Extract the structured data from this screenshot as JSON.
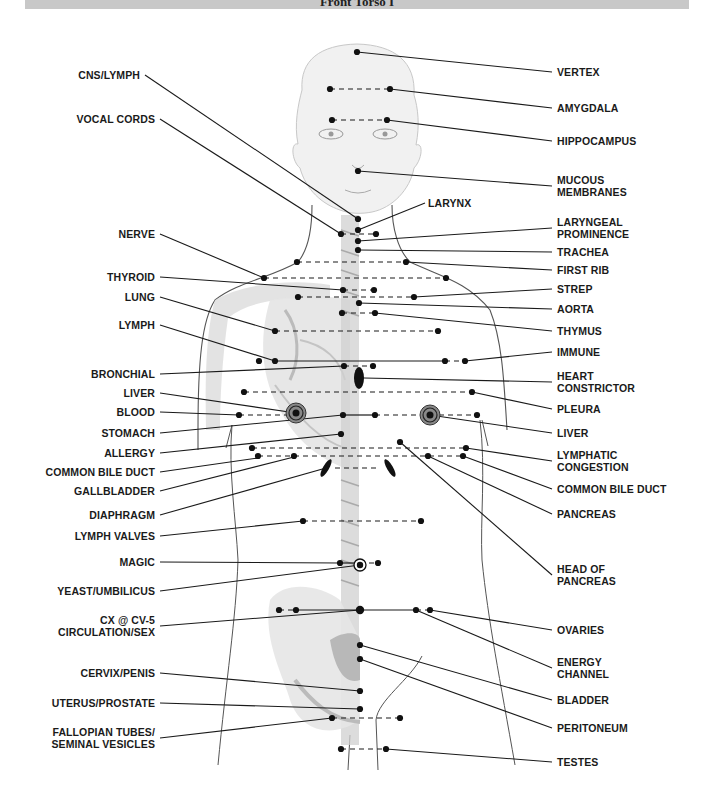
{
  "header": {
    "title": "Front Torso I"
  },
  "colors": {
    "ink": "#1a1a1a",
    "header_band": "#c8c8c8",
    "figure_shade": "#bdbdbd",
    "outline": "#555555"
  },
  "labels_left": [
    {
      "id": "cns-lymph",
      "text": "CNS/LYMPH",
      "x": 140,
      "y": 75,
      "to": [
        358,
        219
      ]
    },
    {
      "id": "vocal-cords",
      "text": "VOCAL CORDS",
      "x": 155,
      "y": 119,
      "to": [
        341,
        234
      ]
    },
    {
      "id": "nerve",
      "text": "NERVE",
      "x": 155,
      "y": 234,
      "to": [
        264,
        278
      ]
    },
    {
      "id": "thyroid",
      "text": "THYROID",
      "x": 155,
      "y": 277,
      "to": [
        343,
        290
      ]
    },
    {
      "id": "lung",
      "text": "LUNG",
      "x": 155,
      "y": 297,
      "to": [
        275,
        331
      ]
    },
    {
      "id": "lymph",
      "text": "LYMPH",
      "x": 155,
      "y": 325,
      "to": [
        275,
        361
      ]
    },
    {
      "id": "bronchial",
      "text": "BRONCHIAL",
      "x": 155,
      "y": 374,
      "to": [
        344,
        366
      ]
    },
    {
      "id": "liver-left",
      "text": "LIVER",
      "x": 155,
      "y": 393,
      "to": [
        296,
        413
      ]
    },
    {
      "id": "blood",
      "text": "BLOOD",
      "x": 155,
      "y": 412,
      "to": [
        239,
        415
      ]
    },
    {
      "id": "stomach",
      "text": "STOMACH",
      "x": 155,
      "y": 433,
      "to": [
        343,
        415
      ]
    },
    {
      "id": "allergy",
      "text": "ALLERGY",
      "x": 155,
      "y": 453,
      "to": [
        341,
        434
      ]
    },
    {
      "id": "common-bile-duct-left",
      "text": "COMMON BILE DUCT",
      "x": 155,
      "y": 472,
      "to": [
        258,
        458
      ]
    },
    {
      "id": "gallbladder",
      "text": "GALLBLADDER",
      "x": 155,
      "y": 491,
      "to": [
        294,
        457
      ]
    },
    {
      "id": "diaphragm",
      "text": "DIAPHRAGM",
      "x": 155,
      "y": 515,
      "to": [
        326,
        468
      ]
    },
    {
      "id": "lymph-valves",
      "text": "LYMPH VALVES",
      "x": 155,
      "y": 536,
      "to": [
        303,
        521
      ]
    },
    {
      "id": "magic",
      "text": "MAGIC",
      "x": 155,
      "y": 562,
      "to": [
        340,
        563
      ]
    },
    {
      "id": "yeast-umbilicus",
      "text": "YEAST/UMBILICUS",
      "x": 155,
      "y": 591,
      "to": [
        360,
        565
      ]
    },
    {
      "id": "cx-cv5",
      "text": "CX @ CV-5\nCIRCULATION/SEX",
      "x": 155,
      "y": 626,
      "to": [
        360,
        610
      ]
    },
    {
      "id": "cervix-penis",
      "text": "CERVIX/PENIS",
      "x": 155,
      "y": 673,
      "to": [
        360,
        691
      ]
    },
    {
      "id": "uterus-prostate",
      "text": "UTERUS/PROSTATE",
      "x": 155,
      "y": 703,
      "to": [
        360,
        709
      ]
    },
    {
      "id": "fallopian",
      "text": "FALLOPIAN TUBES/\nSEMINAL VESICLES",
      "x": 155,
      "y": 738,
      "to": [
        332,
        718
      ]
    }
  ],
  "labels_right": [
    {
      "id": "vertex",
      "text": "VERTEX",
      "x": 557,
      "y": 72,
      "to": [
        357,
        52
      ]
    },
    {
      "id": "amygdala",
      "text": "AMYGDALA",
      "x": 557,
      "y": 108,
      "to": [
        390,
        89
      ]
    },
    {
      "id": "hippocampus",
      "text": "HIPPOCAMPUS",
      "x": 557,
      "y": 141,
      "to": [
        387,
        120
      ]
    },
    {
      "id": "mucous-membranes",
      "text": "MUCOUS\nMEMBRANES",
      "x": 557,
      "y": 186,
      "to": [
        358,
        171
      ]
    },
    {
      "id": "larynx",
      "text": "LARYNX",
      "x": 428,
      "y": 203,
      "to": [
        358,
        230
      ],
      "anchor": [
        425,
        203
      ]
    },
    {
      "id": "laryngeal-prominence",
      "text": "LARYNGEAL\nPROMINENCE",
      "x": 557,
      "y": 228,
      "to": [
        358,
        241
      ]
    },
    {
      "id": "trachea",
      "text": "TRACHEA",
      "x": 557,
      "y": 252,
      "to": [
        358,
        250
      ]
    },
    {
      "id": "first-rib",
      "text": "FIRST RIB",
      "x": 557,
      "y": 270,
      "to": [
        406,
        262
      ]
    },
    {
      "id": "strep",
      "text": "STREP",
      "x": 557,
      "y": 289,
      "to": [
        414,
        297
      ]
    },
    {
      "id": "aorta",
      "text": "AORTA",
      "x": 557,
      "y": 309,
      "to": [
        359,
        303
      ]
    },
    {
      "id": "thymus",
      "text": "THYMUS",
      "x": 557,
      "y": 331,
      "to": [
        375,
        313
      ]
    },
    {
      "id": "immune",
      "text": "IMMUNE",
      "x": 557,
      "y": 352,
      "to": [
        465,
        361
      ]
    },
    {
      "id": "heart-constrictor",
      "text": "HEART\nCONSTRICTOR",
      "x": 557,
      "y": 382,
      "to": [
        364,
        378
      ]
    },
    {
      "id": "pleura",
      "text": "PLEURA",
      "x": 557,
      "y": 409,
      "to": [
        472,
        392
      ]
    },
    {
      "id": "liver-right",
      "text": "LIVER",
      "x": 557,
      "y": 433,
      "to": [
        430,
        415
      ]
    },
    {
      "id": "lymphatic-congestion",
      "text": "LYMPHATIC\nCONGESTION",
      "x": 557,
      "y": 461,
      "to": [
        466,
        448
      ]
    },
    {
      "id": "common-bile-duct-right",
      "text": "COMMON BILE DUCT",
      "x": 557,
      "y": 489,
      "to": [
        463,
        456
      ]
    },
    {
      "id": "pancreas",
      "text": "PANCREAS",
      "x": 557,
      "y": 514,
      "to": [
        428,
        456
      ]
    },
    {
      "id": "head-of-pancreas",
      "text": "HEAD OF\nPANCREAS",
      "x": 557,
      "y": 575,
      "to": [
        400,
        442
      ]
    },
    {
      "id": "ovaries",
      "text": "OVARIES",
      "x": 557,
      "y": 630,
      "to": [
        430,
        610
      ]
    },
    {
      "id": "energy-channel",
      "text": "ENERGY\nCHANNEL",
      "x": 557,
      "y": 668,
      "to": [
        416,
        610
      ]
    },
    {
      "id": "bladder",
      "text": "BLADDER",
      "x": 557,
      "y": 700,
      "to": [
        360,
        645
      ]
    },
    {
      "id": "peritoneum",
      "text": "PERITONEUM",
      "x": 557,
      "y": 728,
      "to": [
        360,
        659
      ]
    },
    {
      "id": "testes",
      "text": "TESTES",
      "x": 557,
      "y": 762,
      "to": [
        386,
        749
      ]
    }
  ],
  "points": [
    [
      357,
      52
    ],
    [
      330,
      89
    ],
    [
      390,
      89
    ],
    [
      332,
      120
    ],
    [
      387,
      120
    ],
    [
      358,
      171
    ],
    [
      358,
      219
    ],
    [
      358,
      230
    ],
    [
      341,
      234
    ],
    [
      376,
      234
    ],
    [
      358,
      241
    ],
    [
      358,
      250
    ],
    [
      297,
      262
    ],
    [
      406,
      262
    ],
    [
      264,
      278
    ],
    [
      446,
      278
    ],
    [
      343,
      290
    ],
    [
      374,
      290
    ],
    [
      298,
      297
    ],
    [
      414,
      297
    ],
    [
      359,
      303
    ],
    [
      342,
      313
    ],
    [
      375,
      313
    ],
    [
      275,
      331
    ],
    [
      438,
      331
    ],
    [
      259,
      361
    ],
    [
      275,
      361
    ],
    [
      445,
      361
    ],
    [
      465,
      361
    ],
    [
      344,
      366
    ],
    [
      373,
      366
    ],
    [
      244,
      392
    ],
    [
      472,
      392
    ],
    [
      239,
      415
    ],
    [
      343,
      415
    ],
    [
      375,
      415
    ],
    [
      477,
      415
    ],
    [
      341,
      434
    ],
    [
      400,
      442
    ],
    [
      252,
      448
    ],
    [
      466,
      448
    ],
    [
      258,
      456
    ],
    [
      294,
      456
    ],
    [
      428,
      456
    ],
    [
      463,
      456
    ],
    [
      303,
      521
    ],
    [
      421,
      521
    ],
    [
      340,
      563
    ],
    [
      378,
      563
    ],
    [
      279,
      610
    ],
    [
      296,
      610
    ],
    [
      416,
      610
    ],
    [
      430,
      610
    ],
    [
      360,
      645
    ],
    [
      360,
      659
    ],
    [
      360,
      691
    ],
    [
      360,
      709
    ],
    [
      332,
      718
    ],
    [
      400,
      718
    ],
    [
      341,
      749
    ],
    [
      386,
      749
    ]
  ],
  "target_points": [
    [
      296,
      413
    ],
    [
      430,
      415
    ]
  ],
  "umbilicus_point": [
    360,
    565
  ],
  "center_point": [
    360,
    610
  ],
  "ellipses": [
    {
      "cx": 359,
      "cy": 378,
      "rx": 5,
      "ry": 11,
      "rot": 0
    },
    {
      "cx": 326,
      "cy": 468,
      "rx": 3,
      "ry": 10,
      "rot": 30
    },
    {
      "cx": 390,
      "cy": 468,
      "rx": 3,
      "ry": 10,
      "rot": -30
    }
  ],
  "dashed_lines": [
    [
      [
        330,
        89
      ],
      [
        390,
        89
      ]
    ],
    [
      [
        332,
        120
      ],
      [
        387,
        120
      ]
    ],
    [
      [
        341,
        234
      ],
      [
        376,
        234
      ]
    ],
    [
      [
        297,
        262
      ],
      [
        406,
        262
      ]
    ],
    [
      [
        264,
        278
      ],
      [
        446,
        278
      ]
    ],
    [
      [
        343,
        290
      ],
      [
        374,
        290
      ]
    ],
    [
      [
        298,
        297
      ],
      [
        414,
        297
      ]
    ],
    [
      [
        342,
        313
      ],
      [
        375,
        313
      ]
    ],
    [
      [
        275,
        331
      ],
      [
        438,
        331
      ]
    ],
    [
      [
        445,
        361
      ],
      [
        465,
        361
      ]
    ],
    [
      [
        344,
        366
      ],
      [
        373,
        366
      ]
    ],
    [
      [
        244,
        392
      ],
      [
        472,
        392
      ]
    ],
    [
      [
        239,
        415
      ],
      [
        296,
        415
      ]
    ],
    [
      [
        375,
        415
      ],
      [
        430,
        415
      ]
    ],
    [
      [
        430,
        415
      ],
      [
        477,
        415
      ]
    ],
    [
      [
        252,
        448
      ],
      [
        466,
        448
      ]
    ],
    [
      [
        258,
        456
      ],
      [
        463,
        456
      ]
    ],
    [
      [
        335,
        468
      ],
      [
        380,
        468
      ]
    ],
    [
      [
        303,
        521
      ],
      [
        421,
        521
      ]
    ],
    [
      [
        360,
        563
      ],
      [
        378,
        563
      ]
    ],
    [
      [
        279,
        610
      ],
      [
        296,
        610
      ]
    ],
    [
      [
        416,
        610
      ],
      [
        430,
        610
      ]
    ],
    [
      [
        332,
        718
      ],
      [
        400,
        718
      ]
    ],
    [
      [
        341,
        749
      ],
      [
        386,
        749
      ]
    ]
  ],
  "solid_lines": [
    [
      [
        275,
        361
      ],
      [
        445,
        361
      ]
    ],
    [
      [
        343,
        415
      ],
      [
        375,
        415
      ]
    ],
    [
      [
        296,
        610
      ],
      [
        416,
        610
      ]
    ],
    [
      [
        340,
        563
      ],
      [
        360,
        563
      ]
    ]
  ]
}
